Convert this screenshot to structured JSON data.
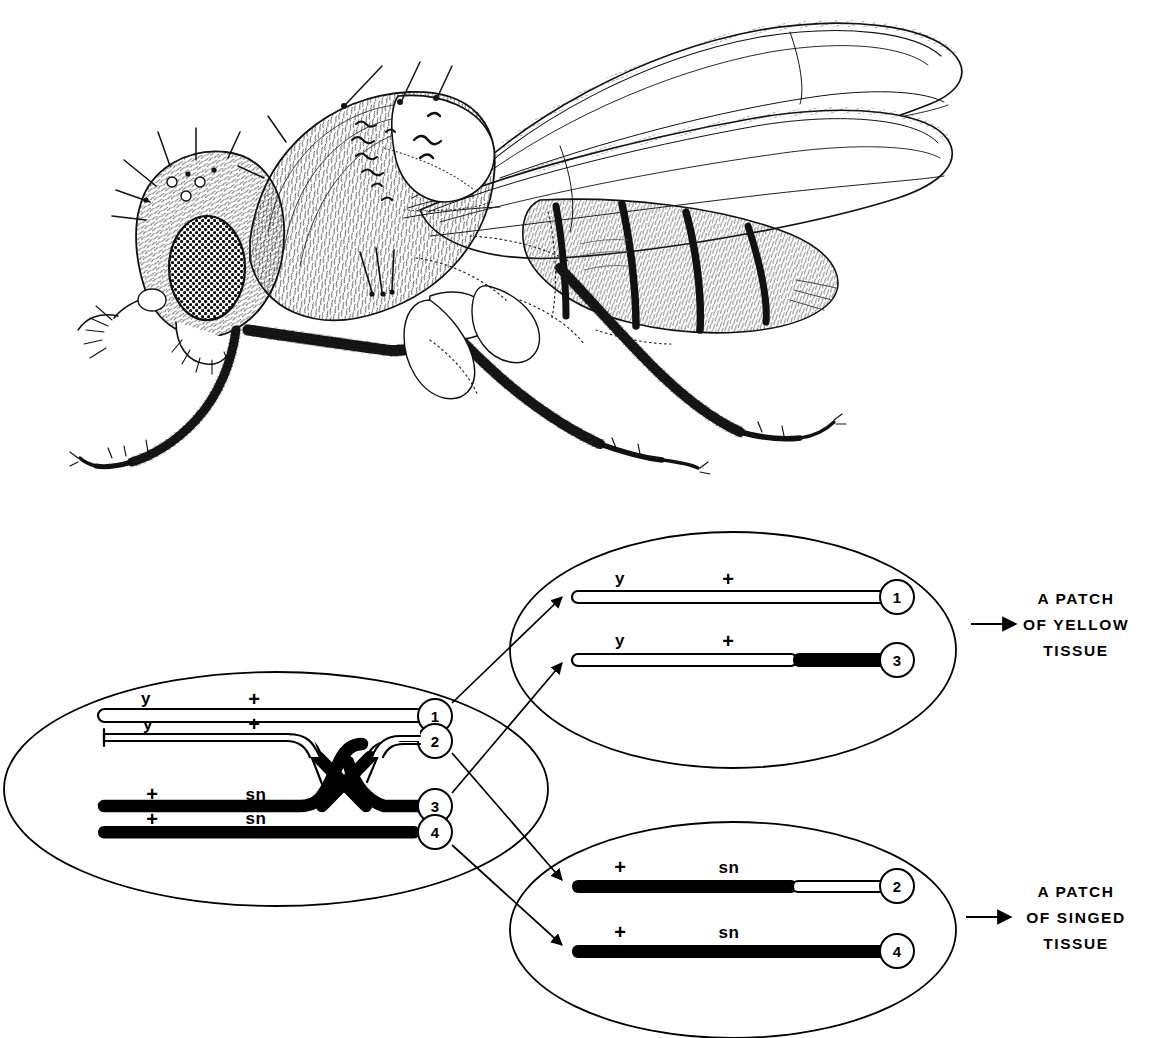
{
  "figure": {
    "organism_illustration": "drosophila-fly-lateral-line-drawing"
  },
  "parent_cell": {
    "name": "parent-cell-ellipse",
    "chromatids": [
      {
        "id": "1",
        "number": "1",
        "left_marker": "y",
        "right_marker": "+",
        "fill": "white"
      },
      {
        "id": "2",
        "number": "2",
        "left_marker": "y",
        "right_marker": "+",
        "fill": "white"
      },
      {
        "id": "3",
        "number": "3",
        "left_marker": "+",
        "right_marker": "sn",
        "fill": "black"
      },
      {
        "id": "4",
        "number": "4",
        "left_marker": "+",
        "right_marker": "sn",
        "fill": "black"
      }
    ],
    "crossover": "crossover-between-chromatid-2-and-3"
  },
  "daughter_cell_top": {
    "name": "daughter-cell-yellow-ellipse",
    "chromatids": [
      {
        "id": "1",
        "number": "1",
        "left_marker": "y",
        "right_marker": "+",
        "fill": "white",
        "distal_fill": "white"
      },
      {
        "id": "3",
        "number": "3",
        "left_marker": "y",
        "right_marker": "+",
        "fill": "white",
        "distal_fill": "black"
      }
    ],
    "outcome_lines": [
      "A  PATCH",
      "OF  YELLOW",
      "TISSUE"
    ]
  },
  "daughter_cell_bottom": {
    "name": "daughter-cell-singed-ellipse",
    "chromatids": [
      {
        "id": "2",
        "number": "2",
        "left_marker": "+",
        "right_marker": "sn",
        "fill": "black",
        "distal_fill": "white"
      },
      {
        "id": "4",
        "number": "4",
        "left_marker": "+",
        "right_marker": "sn",
        "fill": "black",
        "distal_fill": "black"
      }
    ],
    "outcome_lines": [
      "A  PATCH",
      "OF  SINGED",
      "TISSUE"
    ]
  },
  "colors": {
    "ink": "#000000",
    "paper": "#ffffff"
  }
}
